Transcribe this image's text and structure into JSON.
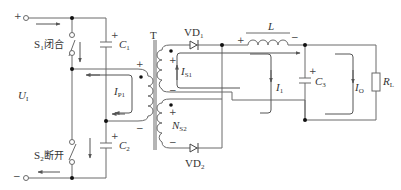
{
  "diagram": {
    "type": "circuit-schematic",
    "title": "",
    "colors": {
      "wire": "#6a6a6a",
      "node": "#111111",
      "text": "#333333"
    },
    "terminals": {
      "positive": "+",
      "negative": "−"
    },
    "input_voltage": {
      "symbol": "U",
      "subscript": "I"
    },
    "switches": {
      "s1": {
        "symbol": "S",
        "subscript": "1",
        "state": "闭合"
      },
      "s2": {
        "symbol": "S",
        "subscript": "2",
        "state": "断开"
      }
    },
    "capacitors": {
      "c1": {
        "symbol": "C",
        "subscript": "1",
        "polarity": "+"
      },
      "c2": {
        "symbol": "C",
        "subscript": "2",
        "polarity": "+"
      },
      "c3": {
        "symbol": "C",
        "subscript": "3",
        "polarity": "+"
      }
    },
    "transformer": {
      "label": "T",
      "primary": {
        "top_polarity": "+",
        "bottom_polarity": "−"
      },
      "secondary1": {
        "top_polarity": "+",
        "bottom_polarity": "−"
      },
      "secondary2": {
        "symbol": "N",
        "subscript": "S2",
        "top_polarity": "+",
        "bottom_polarity": "−"
      }
    },
    "diodes": {
      "vd1": {
        "symbol": "VD",
        "subscript": "1"
      },
      "vd2": {
        "symbol": "VD",
        "subscript": "2"
      }
    },
    "inductor": {
      "symbol": "L",
      "left_polarity": "+",
      "right_polarity": "−"
    },
    "load": {
      "symbol": "R",
      "subscript": "L"
    },
    "currents": {
      "ip1": {
        "symbol": "I",
        "subscript": "P1"
      },
      "is1": {
        "symbol": "I",
        "subscript": "S1"
      },
      "i1": {
        "symbol": "I",
        "subscript": "1"
      },
      "io": {
        "symbol": "I",
        "subscript": "O"
      }
    }
  }
}
